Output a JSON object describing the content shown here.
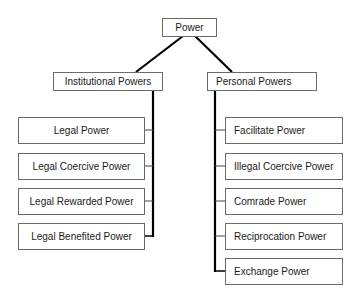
{
  "diagram": {
    "type": "hierarchy-tree",
    "root": {
      "label": "Power"
    },
    "branches": [
      {
        "label": "Institutional Powers",
        "children": [
          {
            "label": "Legal Power"
          },
          {
            "label": "Legal Coercive Power"
          },
          {
            "label": "Legal Rewarded Power"
          },
          {
            "label": "Legal Benefited Power"
          }
        ]
      },
      {
        "label": "Personal Powers",
        "children": [
          {
            "label": "Facilitate Power"
          },
          {
            "label": "Illegal Coercive Power"
          },
          {
            "label": "Comrade Power"
          },
          {
            "label": "Reciprocation Power"
          },
          {
            "label": "Exchange Power"
          }
        ]
      }
    ],
    "colors": {
      "line": "#000000",
      "box_border": "#6a6a6a",
      "text": "#1a1a1a",
      "background": "#ffffff"
    }
  }
}
